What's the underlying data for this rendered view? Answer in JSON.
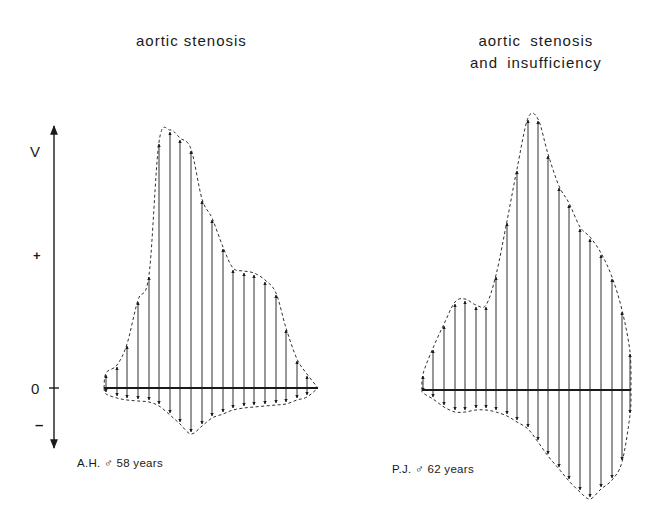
{
  "titles": {
    "left": "aortic stenosis",
    "right_line1": "aortic  stenosis",
    "right_line2": "and insufficiency"
  },
  "axis": {
    "label_top": "V",
    "label_plus": "+",
    "label_zero": "0",
    "label_minus": "–"
  },
  "patients": {
    "left": "A.H. ♂ 58 years",
    "right": "P.J. ♂ 62 years"
  },
  "colors": {
    "ink": "#1a1a1a",
    "background": "#ffffff"
  },
  "diagrams": [
    {
      "id": "left",
      "baseline_y": 388,
      "x_start": 104,
      "x_end": 318,
      "vectors": [
        {
          "x": 106,
          "top": 375,
          "bottom": 392
        },
        {
          "x": 117,
          "top": 367,
          "bottom": 396
        },
        {
          "x": 127,
          "top": 346,
          "bottom": 398
        },
        {
          "x": 138,
          "top": 302,
          "bottom": 399
        },
        {
          "x": 149,
          "top": 277,
          "bottom": 400
        },
        {
          "x": 159,
          "top": 144,
          "bottom": 404
        },
        {
          "x": 170,
          "top": 132,
          "bottom": 413
        },
        {
          "x": 180,
          "top": 140,
          "bottom": 422
        },
        {
          "x": 191,
          "top": 151,
          "bottom": 432
        },
        {
          "x": 202,
          "top": 201,
          "bottom": 424
        },
        {
          "x": 212,
          "top": 220,
          "bottom": 416
        },
        {
          "x": 223,
          "top": 249,
          "bottom": 412
        },
        {
          "x": 233,
          "top": 270,
          "bottom": 408
        },
        {
          "x": 244,
          "top": 273,
          "bottom": 406
        },
        {
          "x": 254,
          "top": 275,
          "bottom": 405
        },
        {
          "x": 265,
          "top": 282,
          "bottom": 404
        },
        {
          "x": 276,
          "top": 295,
          "bottom": 403
        },
        {
          "x": 286,
          "top": 330,
          "bottom": 402
        },
        {
          "x": 297,
          "top": 361,
          "bottom": 398
        },
        {
          "x": 307,
          "top": 376,
          "bottom": 395
        }
      ]
    },
    {
      "id": "right",
      "baseline_y": 390,
      "x_start": 422,
      "x_end": 631,
      "vectors": [
        {
          "x": 423,
          "top": 376,
          "bottom": 391
        },
        {
          "x": 433,
          "top": 350,
          "bottom": 397
        },
        {
          "x": 444,
          "top": 326,
          "bottom": 405
        },
        {
          "x": 455,
          "top": 304,
          "bottom": 410
        },
        {
          "x": 465,
          "top": 301,
          "bottom": 410
        },
        {
          "x": 476,
          "top": 307,
          "bottom": 408
        },
        {
          "x": 486,
          "top": 307,
          "bottom": 408
        },
        {
          "x": 496,
          "top": 277,
          "bottom": 410
        },
        {
          "x": 507,
          "top": 223,
          "bottom": 414
        },
        {
          "x": 517,
          "top": 171,
          "bottom": 420
        },
        {
          "x": 528,
          "top": 120,
          "bottom": 427
        },
        {
          "x": 538,
          "top": 121,
          "bottom": 440
        },
        {
          "x": 548,
          "top": 156,
          "bottom": 454
        },
        {
          "x": 559,
          "top": 188,
          "bottom": 467
        },
        {
          "x": 569,
          "top": 205,
          "bottom": 479
        },
        {
          "x": 580,
          "top": 229,
          "bottom": 490
        },
        {
          "x": 590,
          "top": 239,
          "bottom": 497
        },
        {
          "x": 601,
          "top": 255,
          "bottom": 487
        },
        {
          "x": 612,
          "top": 279,
          "bottom": 478
        },
        {
          "x": 622,
          "top": 312,
          "bottom": 460
        },
        {
          "x": 630,
          "top": 354,
          "bottom": 413
        }
      ]
    }
  ]
}
